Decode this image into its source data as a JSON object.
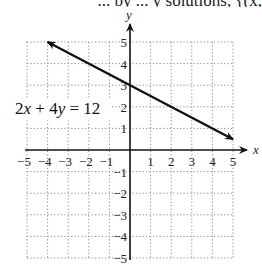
{
  "top_text": "... by ... y solutions, {(x,",
  "chart_data": {
    "type": "line",
    "title": "",
    "xlabel": "x",
    "ylabel": "y",
    "xlim": [
      -5,
      5
    ],
    "ylim": [
      -5,
      5
    ],
    "grid": true,
    "x_ticks": [
      -5,
      -4,
      -3,
      -2,
      -1,
      1,
      2,
      3,
      4,
      5
    ],
    "y_ticks": [
      -5,
      -4,
      -3,
      -2,
      -1,
      1,
      2,
      3,
      4,
      5
    ],
    "x_tick_labels": [
      "−5",
      "−4",
      "−3",
      "−2",
      "−1",
      "1",
      "2",
      "3",
      "4",
      "5"
    ],
    "y_tick_labels": [
      "−5",
      "−4",
      "−3",
      "−2",
      "−1",
      "1",
      "2",
      "3",
      "4",
      "5"
    ],
    "series": [
      {
        "name": "2x + 4y = 12",
        "equation": "2x + 4y = 12",
        "x": [
          -4,
          5
        ],
        "y": [
          5,
          0.5
        ],
        "arrows": "both"
      }
    ],
    "annotations": [
      {
        "text": "2x + 4y = 12",
        "x": -3.2,
        "y": 1.6
      }
    ]
  }
}
